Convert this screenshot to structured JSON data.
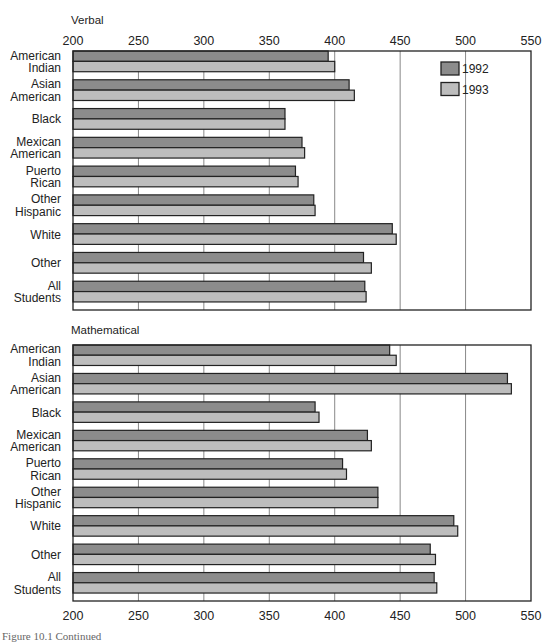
{
  "figure": {
    "caption": "Figure 10.1  Continued"
  },
  "legend": [
    {
      "label": "1992",
      "color": "#8c8c8c"
    },
    {
      "label": "1993",
      "color": "#bdbdbd"
    }
  ],
  "colors": {
    "series_1992": "#8c8c8c",
    "series_1993": "#bdbdbd",
    "outline": "#222222",
    "gridline": "#888888"
  },
  "chart_data": [
    {
      "type": "bar",
      "orientation": "horizontal",
      "title": "Verbal",
      "xlabel": "",
      "ylabel": "",
      "xlim": [
        200,
        550
      ],
      "x_ticks": [
        200,
        250,
        300,
        350,
        400,
        450,
        500,
        550
      ],
      "x_tick_position": "top",
      "grid": true,
      "legend_position": "upper right inside",
      "categories": [
        "American Indian",
        "Asian American",
        "Black",
        "Mexican American",
        "Puerto Rican",
        "Other Hispanic",
        "White",
        "Other",
        "All Students"
      ],
      "category_lines": [
        [
          "American",
          "Indian"
        ],
        [
          "Asian",
          "American"
        ],
        [
          "Black"
        ],
        [
          "Mexican",
          "American"
        ],
        [
          "Puerto",
          "Rican"
        ],
        [
          "Other",
          "Hispanic"
        ],
        [
          "White"
        ],
        [
          "Other"
        ],
        [
          "All",
          "Students"
        ]
      ],
      "series": [
        {
          "name": "1992",
          "values": [
            395,
            411,
            362,
            375,
            370,
            384,
            444,
            422,
            423
          ]
        },
        {
          "name": "1993",
          "values": [
            400,
            415,
            362,
            377,
            372,
            385,
            447,
            428,
            424
          ]
        }
      ]
    },
    {
      "type": "bar",
      "orientation": "horizontal",
      "title": "Mathematical",
      "xlabel": "",
      "ylabel": "",
      "xlim": [
        200,
        550
      ],
      "x_ticks": [
        200,
        250,
        300,
        350,
        400,
        450,
        500,
        550
      ],
      "x_tick_position": "bottom",
      "grid": true,
      "categories": [
        "American Indian",
        "Asian American",
        "Black",
        "Mexican American",
        "Puerto Rican",
        "Other Hispanic",
        "White",
        "Other",
        "All Students"
      ],
      "category_lines": [
        [
          "American",
          "Indian"
        ],
        [
          "Asian",
          "American"
        ],
        [
          "Black"
        ],
        [
          "Mexican",
          "American"
        ],
        [
          "Puerto",
          "Rican"
        ],
        [
          "Other",
          "Hispanic"
        ],
        [
          "White"
        ],
        [
          "Other"
        ],
        [
          "All",
          "Students"
        ]
      ],
      "series": [
        {
          "name": "1992",
          "values": [
            442,
            532,
            385,
            425,
            406,
            433,
            491,
            473,
            476
          ]
        },
        {
          "name": "1993",
          "values": [
            447,
            535,
            388,
            428,
            409,
            433,
            494,
            477,
            478
          ]
        }
      ]
    }
  ]
}
